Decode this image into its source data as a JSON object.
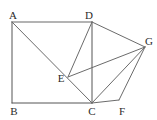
{
  "figure": {
    "kind": "geometry-diagram",
    "canvas": {
      "width": 157,
      "height": 120,
      "background": "#ffffff"
    },
    "style": {
      "edge_color_dark": "#555555",
      "edge_color_light": "#9a9a9a",
      "label_color": "#2b2b2b",
      "stroke_width": 1
    },
    "points": [
      {
        "id": "A",
        "label": "A",
        "x": 12,
        "y": 22,
        "label_x": 13,
        "label_y": 19
      },
      {
        "id": "B",
        "label": "B",
        "x": 12,
        "y": 103,
        "label_x": 14,
        "label_y": 115
      },
      {
        "id": "C",
        "label": "C",
        "x": 92,
        "y": 103,
        "label_x": 92,
        "label_y": 115
      },
      {
        "id": "D",
        "label": "D",
        "x": 92,
        "y": 22,
        "label_x": 89,
        "label_y": 19
      },
      {
        "id": "E",
        "label": "E",
        "x": 68,
        "y": 77,
        "label_x": 61,
        "label_y": 82
      },
      {
        "id": "F",
        "label": "F",
        "x": 119,
        "y": 100,
        "label_x": 122,
        "label_y": 115
      },
      {
        "id": "G",
        "label": "G",
        "x": 145,
        "y": 47,
        "label_x": 149,
        "label_y": 45
      }
    ],
    "edges": [
      {
        "id": "AD",
        "from": "A",
        "to": "D",
        "color": "#9a9a9a",
        "width": 1.4
      },
      {
        "id": "AB",
        "from": "A",
        "to": "B",
        "color": "#555555",
        "width": 1
      },
      {
        "id": "BC",
        "from": "B",
        "to": "C",
        "color": "#555555",
        "width": 1
      },
      {
        "id": "DC",
        "from": "D",
        "to": "C",
        "color": "#555555",
        "width": 1
      },
      {
        "id": "AC",
        "from": "A",
        "to": "C",
        "color": "#6b6b6b",
        "width": 1
      },
      {
        "id": "DE",
        "from": "D",
        "to": "E",
        "color": "#6b6b6b",
        "width": 1
      },
      {
        "id": "EG",
        "from": "E",
        "to": "G",
        "color": "#6b6b6b",
        "width": 1
      },
      {
        "id": "DG",
        "from": "D",
        "to": "G",
        "color": "#6b6b6b",
        "width": 1
      },
      {
        "id": "CG",
        "from": "C",
        "to": "G",
        "color": "#6b6b6b",
        "width": 1
      },
      {
        "id": "CF",
        "from": "C",
        "to": "F",
        "color": "#6b6b6b",
        "width": 1
      },
      {
        "id": "FG",
        "from": "F",
        "to": "G",
        "color": "#6b6b6b",
        "width": 1
      }
    ],
    "labels": {
      "A": "A",
      "B": "B",
      "C": "C",
      "D": "D",
      "E": "E",
      "F": "F",
      "G": "G"
    }
  }
}
